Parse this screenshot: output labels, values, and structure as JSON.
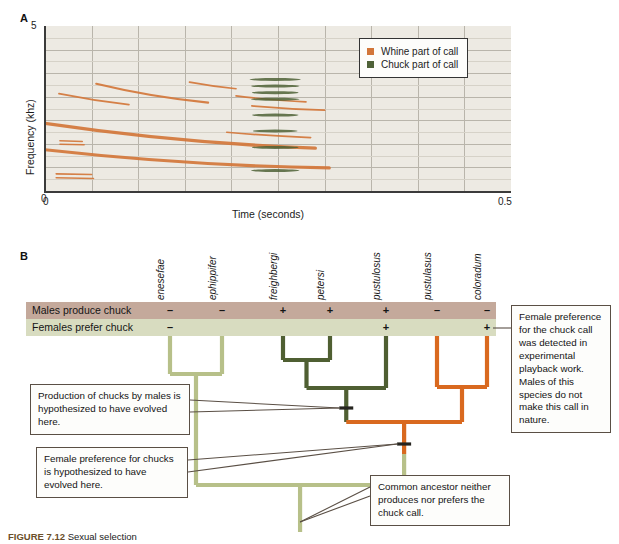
{
  "figure": {
    "panelA_letter": "A",
    "panelB_letter": "B",
    "caption_label": "FIGURE 7.12",
    "caption_text": "Sexual selection"
  },
  "chart_data": {
    "type": "line",
    "xlabel": "Time (seconds)",
    "ylabel": "Frequency (khz)",
    "xlim": [
      0,
      0.5
    ],
    "ylim": [
      0,
      5
    ],
    "xticks": [
      "0",
      "0.5"
    ],
    "yticks": [
      "0",
      "5"
    ],
    "grid": true,
    "legend_position": "top-right",
    "legend": [
      {
        "label": "Whine part of call",
        "color": "#d2763a",
        "key": "whine"
      },
      {
        "label": "Chuck part of call",
        "color": "#4e6136",
        "key": "chuck"
      }
    ],
    "series": [
      {
        "name": "Whine part of call",
        "color": "#d2763a",
        "note": "Descending frequency-modulated sweeps, harmonic stack 0 to 0.28 s",
        "traces": [
          {
            "x0": 0.0,
            "y0": 2.05,
            "x1": 0.29,
            "y1": 1.3,
            "w": 3.4,
            "sag": 0.22
          },
          {
            "x0": 0.0,
            "y0": 1.25,
            "x1": 0.305,
            "y1": 0.7,
            "w": 3.2,
            "sag": 0.2
          },
          {
            "x0": 0.015,
            "y0": 2.95,
            "x1": 0.09,
            "y1": 2.62,
            "w": 1.8,
            "sag": 0.05
          },
          {
            "x0": 0.055,
            "y0": 3.25,
            "x1": 0.175,
            "y1": 2.68,
            "w": 2.2,
            "sag": 0.12
          },
          {
            "x0": 0.155,
            "y0": 3.3,
            "x1": 0.205,
            "y1": 3.1,
            "w": 1.6,
            "sag": 0.03
          },
          {
            "x0": 0.205,
            "y0": 2.88,
            "x1": 0.28,
            "y1": 2.7,
            "w": 1.7,
            "sag": 0.04
          },
          {
            "x0": 0.195,
            "y0": 1.78,
            "x1": 0.285,
            "y1": 1.62,
            "w": 1.7,
            "sag": 0.03
          },
          {
            "x0": 0.222,
            "y0": 2.58,
            "x1": 0.3,
            "y1": 2.45,
            "w": 1.8,
            "sag": 0.03
          },
          {
            "x0": 0.016,
            "y0": 1.52,
            "x1": 0.04,
            "y1": 1.5,
            "w": 1.5,
            "sag": 0.0
          },
          {
            "x0": 0.016,
            "y0": 1.42,
            "x1": 0.042,
            "y1": 1.4,
            "w": 1.5,
            "sag": 0.0
          },
          {
            "x0": 0.012,
            "y0": 0.52,
            "x1": 0.05,
            "y1": 0.5,
            "w": 1.6,
            "sag": 0.0
          },
          {
            "x0": 0.012,
            "y0": 0.4,
            "x1": 0.052,
            "y1": 0.38,
            "w": 1.6,
            "sag": 0.0
          }
        ]
      },
      {
        "name": "Chuck part of call",
        "color": "#4e6136",
        "note": "Broadband harmonic stack near 0.22 to 0.28 s",
        "bars": [
          {
            "xc": 0.247,
            "y": 3.38,
            "len": 0.055,
            "h": 3.0
          },
          {
            "xc": 0.247,
            "y": 3.18,
            "len": 0.052,
            "h": 3.0
          },
          {
            "xc": 0.247,
            "y": 2.98,
            "len": 0.05,
            "h": 3.0
          },
          {
            "xc": 0.247,
            "y": 2.78,
            "len": 0.052,
            "h": 3.0
          },
          {
            "xc": 0.247,
            "y": 2.3,
            "len": 0.05,
            "h": 3.0
          },
          {
            "xc": 0.247,
            "y": 1.82,
            "len": 0.048,
            "h": 3.0
          },
          {
            "xc": 0.247,
            "y": 1.32,
            "len": 0.05,
            "h": 3.0
          },
          {
            "xc": 0.247,
            "y": 0.62,
            "len": 0.052,
            "h": 3.0
          }
        ]
      }
    ]
  },
  "panelB": {
    "species": [
      "P. enesefae",
      "P. ephippifer",
      "P. freighbergi",
      "P. petersi",
      "P. pustulosus",
      "P. pustulasus",
      "P. coloradum"
    ],
    "traits": [
      {
        "label": "Males produce chuck",
        "band_color": "#c4a99b",
        "marks": [
          "–",
          "–",
          "+",
          "+",
          "+",
          "–",
          "–"
        ]
      },
      {
        "label": "Females prefer chuck",
        "band_color": "#d8dcc0",
        "marks": [
          "–",
          "",
          "",
          "",
          "+",
          "",
          "+"
        ]
      }
    ],
    "branch_colors": {
      "pale_green": "#b7c089",
      "dark_green": "#4f5f32",
      "orange": "#d9691f"
    },
    "callouts": [
      {
        "id": "chuck-production",
        "text": "Production of chucks by males is hypothesized to have evolved here."
      },
      {
        "id": "female-preference",
        "text": "Female preference for chucks is hypothesized to have evolved here."
      },
      {
        "id": "common-ancestor",
        "text": "Common ancestor neither produces nor prefers the chuck call."
      },
      {
        "id": "playback-note",
        "text": "Female preference for the chuck call was detected in experimental playback work. Males of this species do not make this call in nature."
      }
    ]
  }
}
